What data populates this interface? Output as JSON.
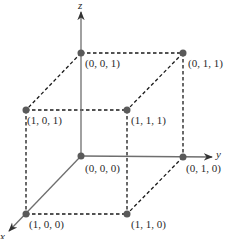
{
  "diagram": {
    "axes": {
      "x": {
        "label": "x"
      },
      "y": {
        "label": "y"
      },
      "z": {
        "label": "z"
      }
    },
    "vertices": [
      {
        "id": "v000",
        "label": "(0, 0, 0)"
      },
      {
        "id": "v001",
        "label": "(0, 0, 1)"
      },
      {
        "id": "v011",
        "label": "(0, 1, 1)"
      },
      {
        "id": "v101",
        "label": "(1, 0, 1)"
      },
      {
        "id": "v111",
        "label": "(1, 1, 1)"
      },
      {
        "id": "v010",
        "label": "(0, 1, 0)"
      },
      {
        "id": "v100",
        "label": "(1, 0, 0)"
      },
      {
        "id": "v110",
        "label": "(1, 1, 0)"
      }
    ],
    "colors": {
      "axis": "#6e6e6e",
      "edge": "#1a1a1a",
      "point": "#5a5a5a"
    }
  }
}
